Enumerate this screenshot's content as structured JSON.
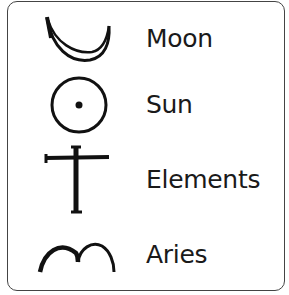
{
  "legend": {
    "items": [
      {
        "symbol": "moon-crescent-icon",
        "label": "Moon"
      },
      {
        "symbol": "sun-circle-dot-icon",
        "label": "Sun"
      },
      {
        "symbol": "elements-cross-icon",
        "label": "Elements"
      },
      {
        "symbol": "aries-horns-icon",
        "label": "Aries"
      }
    ]
  }
}
